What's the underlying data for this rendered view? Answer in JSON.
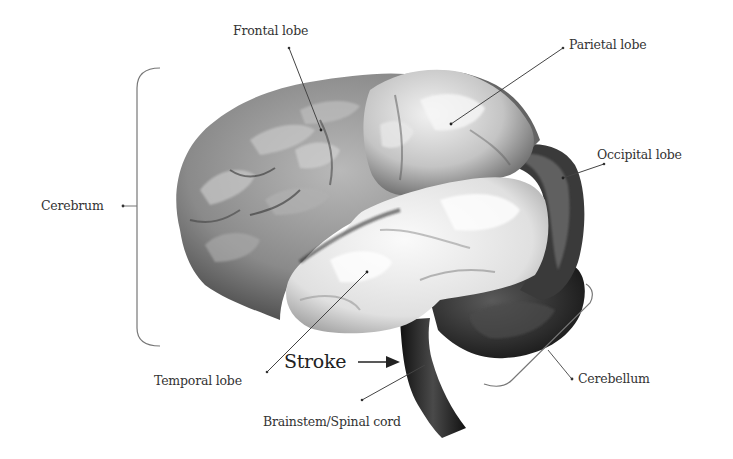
{
  "diagram": {
    "labels": {
      "frontal": "Frontal lobe",
      "parietal": "Parietal lobe",
      "occipital": "Occipital lobe",
      "cerebrum": "Cerebrum",
      "temporal": "Temporal lobe",
      "brainstem": "Brainstem/Spinal cord",
      "cerebellum": "Cerebellum",
      "stroke": "Stroke"
    },
    "colors": {
      "background": "#ffffff",
      "text": "#333333",
      "leader_line": "#444444",
      "bracket": "#777777",
      "brain_dark": "#1a1a1a",
      "brain_mid": "#6e6e6e",
      "brain_light": "#e6e6e6"
    }
  }
}
